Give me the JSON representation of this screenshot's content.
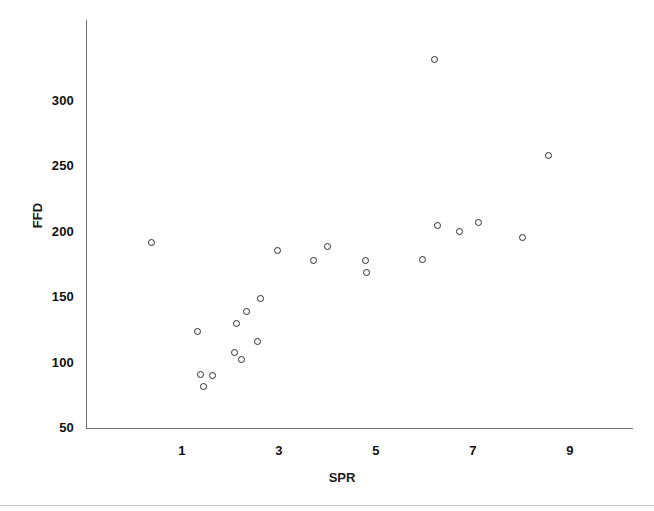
{
  "chart_data": {
    "type": "scatter",
    "title": "",
    "xlabel": "SPR",
    "ylabel": "FFD",
    "xlim": [
      0,
      9.6
    ],
    "ylim": [
      50,
      345
    ],
    "xticks": [
      1,
      3,
      5,
      7,
      9
    ],
    "yticks": [
      50,
      100,
      150,
      200,
      250,
      300
    ],
    "grid": false,
    "legend": null,
    "marker": "open-circle",
    "marker_color": "#2b2b2b",
    "points": [
      {
        "x": 0.38,
        "y": 192
      },
      {
        "x": 1.31,
        "y": 124
      },
      {
        "x": 1.39,
        "y": 91
      },
      {
        "x": 1.44,
        "y": 82
      },
      {
        "x": 1.62,
        "y": 90
      },
      {
        "x": 2.09,
        "y": 108
      },
      {
        "x": 2.13,
        "y": 130
      },
      {
        "x": 2.23,
        "y": 102
      },
      {
        "x": 2.32,
        "y": 139
      },
      {
        "x": 2.56,
        "y": 116
      },
      {
        "x": 2.62,
        "y": 149
      },
      {
        "x": 2.96,
        "y": 186
      },
      {
        "x": 3.71,
        "y": 178
      },
      {
        "x": 4.0,
        "y": 189
      },
      {
        "x": 4.78,
        "y": 178
      },
      {
        "x": 4.8,
        "y": 169
      },
      {
        "x": 5.95,
        "y": 179
      },
      {
        "x": 6.2,
        "y": 332
      },
      {
        "x": 6.26,
        "y": 205
      },
      {
        "x": 6.73,
        "y": 200
      },
      {
        "x": 7.11,
        "y": 207
      },
      {
        "x": 8.02,
        "y": 196
      },
      {
        "x": 8.56,
        "y": 258
      }
    ]
  },
  "axis": {
    "y_title": "FFD",
    "x_title": "SPR",
    "y_tick_labels": [
      "300",
      "250",
      "200",
      "150",
      "100",
      "50"
    ],
    "x_tick_labels": [
      "1",
      "3",
      "5",
      "7",
      "9"
    ]
  }
}
